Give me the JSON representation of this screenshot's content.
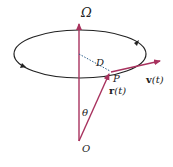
{
  "diagram": {
    "colors": {
      "vector": "#a8325e",
      "orbit": "#222222",
      "dotted": "#2a5d8a",
      "text": "#222222"
    },
    "labels": {
      "omega": "Ω",
      "distance": "D",
      "point": "P",
      "velocity_bold": "v",
      "velocity_arg": "(t)",
      "position_bold": "r",
      "position_arg": "(t)",
      "angle": "θ",
      "origin": "O"
    }
  }
}
